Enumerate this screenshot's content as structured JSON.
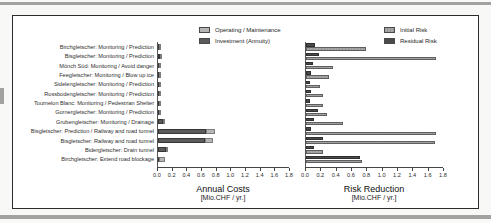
{
  "figure_caption": "",
  "chart_data": [
    {
      "type": "bar",
      "variant": "stacked-horizontal",
      "title": "Annual Costs",
      "xlabel_unit": "[Mio.CHF / yr.]",
      "xlim": [
        0,
        1.8
      ],
      "xticks": [
        "0.0",
        "0.2",
        "0.4",
        "0.6",
        "0.8",
        "1.0",
        "1.2",
        "1.4",
        "1.6",
        "1.8"
      ],
      "grid": false,
      "legend_position": "top",
      "legend": [
        {
          "label": "Operating / Maintenance",
          "color": "#b6b6b6"
        },
        {
          "label": "Investment (Annuity)",
          "color": "#5a5a5a"
        }
      ],
      "categories": [
        "Birchgletscher: Monitoring / Prediction",
        "Bisgletscher: Monitoring / Prediction",
        "Mönch Süd: Monitoring / Avoid danger",
        "Feegletscher: Monitoring / Blow up ice",
        "Sidelengletscher: Monitoring / Prediction",
        "Rossbodengletscher: Monitoring / Prediction",
        "Tournelon Blanc: Monitoring / Pedestrian Shelter",
        "Gornergletscher: Monitoring / Prediction",
        "Grubengletscher: Monitoring / Drainage",
        "Bisgletscher: Prediction / Railway and road tunnel",
        "Bisgletscher: Railway and road tunnel",
        "Bidergletscher: Drain tunnel",
        "Birchgletscher: Extend road blockage"
      ],
      "series": [
        {
          "name": "Investment (Annuity)",
          "color": "#5a5a5a",
          "values": [
            0.02,
            0.03,
            0.01,
            0.02,
            0.01,
            0.01,
            0.01,
            0.01,
            0.07,
            0.66,
            0.64,
            0.11,
            0.01
          ]
        },
        {
          "name": "Operating / Maintenance",
          "color": "#b6b6b6",
          "values": [
            0.01,
            0.01,
            0.005,
            0.005,
            0.005,
            0.005,
            0.005,
            0.005,
            0.01,
            0.12,
            0.11,
            0.02,
            0.08
          ]
        }
      ]
    },
    {
      "type": "bar",
      "variant": "grouped-horizontal",
      "title": "Risk Reduction",
      "xlabel_unit": "[Mio.CHF / yr.]",
      "xlim": [
        0,
        1.8
      ],
      "xticks": [
        "0.0",
        "0.2",
        "0.4",
        "0.6",
        "0.8",
        "1.0",
        "1.2",
        "1.4",
        "1.6",
        "1.8"
      ],
      "grid": false,
      "legend_position": "top",
      "legend": [
        {
          "label": "Initial Risk",
          "color": "#a6a6a6"
        },
        {
          "label": "Residual Risk",
          "color": "#4a4a4a"
        }
      ],
      "categories": [
        "Birchgletscher: Monitoring / Prediction",
        "Bisgletscher: Monitoring / Prediction",
        "Mönch Süd: Monitoring / Avoid danger",
        "Feegletscher: Monitoring / Blow up ice",
        "Sidelengletscher: Monitoring / Prediction",
        "Rossbodengletscher: Monitoring / Prediction",
        "Tournelon Blanc: Monitoring / Pedestrian Shelter",
        "Gornergletscher: Monitoring / Prediction",
        "Grubengletscher: Monitoring / Drainage",
        "Bisgletscher: Prediction / Railway and road tunnel",
        "Bisgletscher: Railway and road tunnel",
        "Bidergletscher: Drain tunnel",
        "Birchgletscher: Extend road blockage"
      ],
      "series": [
        {
          "name": "Residual Risk",
          "color": "#4a4a4a",
          "values": [
            0.12,
            0.17,
            0.09,
            0.07,
            0.05,
            0.07,
            0.05,
            0.15,
            0.11,
            0.07,
            0.22,
            0.11,
            0.7
          ]
        },
        {
          "name": "Initial Risk",
          "color": "#a6a6a6",
          "values": [
            0.78,
            1.7,
            0.35,
            0.3,
            0.18,
            0.22,
            0.22,
            0.27,
            0.48,
            1.7,
            1.68,
            0.22,
            0.73
          ]
        }
      ]
    }
  ]
}
